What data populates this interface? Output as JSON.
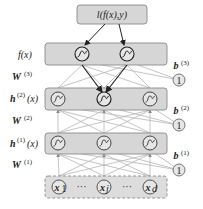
{
  "loss": {
    "label": "l(f(x),y)"
  },
  "layers": [
    {
      "id": "output",
      "label": "f(x)",
      "nodes": [
        "sigmoid",
        "sigmoid"
      ]
    },
    {
      "id": "hidden2",
      "label_main": "h",
      "label_sup": "(2)",
      "label_tail": "(x)",
      "nodes": [
        "sigmoid",
        "sigmoid",
        "sigmoid"
      ]
    },
    {
      "id": "hidden1",
      "label_main": "h",
      "label_sup": "(1)",
      "label_tail": "(x)",
      "nodes": [
        "sigmoid",
        "sigmoid",
        "sigmoid"
      ]
    },
    {
      "id": "input",
      "nodes": [
        "x_1",
        "...",
        "x_j",
        "...",
        "x_d"
      ]
    }
  ],
  "weights": [
    {
      "label_main": "W",
      "label_sup": "(3)"
    },
    {
      "label_main": "W",
      "label_sup": "(2)"
    },
    {
      "label_main": "W",
      "label_sup": "(1)"
    }
  ],
  "biases": [
    {
      "label_main": "b",
      "label_sup": "(3)",
      "node": "1"
    },
    {
      "label_main": "b",
      "label_sup": "(2)",
      "node": "1"
    },
    {
      "label_main": "b",
      "label_sup": "(1)",
      "node": "1"
    }
  ],
  "inputs": {
    "x1": "x",
    "x1_sub": "1",
    "xj": "x",
    "xj_sub": "j",
    "xd": "x",
    "xd_sub": "d",
    "dots": "···"
  },
  "colors": {
    "box_fill": "#d4d4d4",
    "box_stroke": "#888888",
    "node_fill": "#e6e6e6",
    "edge": "#b0b0b0",
    "edge_dark": "#333333"
  }
}
